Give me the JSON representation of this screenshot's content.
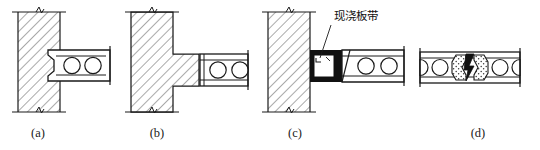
{
  "figure": {
    "background_color": "#ffffff",
    "line_color": "#1a1a1a",
    "hatch_color": "#555555",
    "fill_black": "#111111",
    "stipple_color": "#444444",
    "panels": [
      {
        "key": "a",
        "caption": "(a)",
        "caption_x": 38,
        "caption_y": 137,
        "description": "hollow-core slab bearing on wall with notched keyed end",
        "wall": {
          "x": 18,
          "y": 12,
          "width": 42,
          "height": 100
        },
        "slab": {
          "x": 48,
          "y": 50,
          "width": 62,
          "height": 31,
          "voids": 2
        }
      },
      {
        "key": "b",
        "caption": "(b)",
        "caption_x": 157,
        "caption_y": 137,
        "description": "slab supported on hatched corbel ledge projecting from wall",
        "wall": {
          "x": 131,
          "y": 12,
          "width": 42,
          "height": 100
        },
        "ledge": {
          "x": 173,
          "y": 54,
          "width": 26,
          "height": 32
        },
        "slab": {
          "x": 200,
          "y": 54,
          "width": 48,
          "height": 32,
          "voids": 2
        }
      },
      {
        "key": "c",
        "caption": "(c)",
        "caption_x": 295,
        "caption_y": 137,
        "description": "cast-in-place slab band pocket between wall and slab",
        "wall": {
          "x": 268,
          "y": 12,
          "width": 42,
          "height": 100
        },
        "band": {
          "x": 310,
          "y": 50,
          "width": 32,
          "height": 32
        },
        "slab": {
          "x": 342,
          "y": 50,
          "width": 62,
          "height": 32,
          "voids": 2
        },
        "annotation": {
          "text": "现浇板带",
          "text_x": 334,
          "text_y": 20,
          "leader": {
            "x1": 331,
            "y1": 25,
            "x2": 320,
            "y2": 58
          }
        }
      },
      {
        "key": "d",
        "caption": "(d)",
        "caption_x": 478,
        "caption_y": 137,
        "description": "longitudinal joint between two slabs with grouted keyway and Z-shaped tie",
        "slab_left": {
          "x": 420,
          "y": 52,
          "width": 48,
          "height": 31,
          "voids": 2
        },
        "slab_right": {
          "x": 468,
          "y": 52,
          "width": 52,
          "height": 31,
          "voids": 2
        },
        "joint": {
          "x": 455,
          "y": 55,
          "width": 30,
          "height": 26,
          "fill": "stipple",
          "key": "z-shape"
        }
      }
    ],
    "symbols": {
      "break_line": "zigzag-break-mark",
      "hatch": "45-degree-section-hatch",
      "void": "circular-core-void"
    }
  }
}
